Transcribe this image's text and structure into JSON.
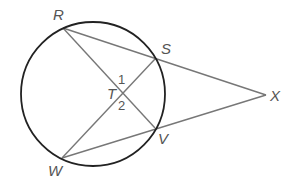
{
  "diagram": {
    "type": "circle-secants",
    "colors": {
      "circle": "#222222",
      "segment": "#777777",
      "label": "#555555",
      "background": "#ffffff"
    },
    "circle": {
      "cx": 93,
      "cy": 94,
      "r": 72
    },
    "points": {
      "R": {
        "label": "R",
        "x": 63,
        "y": 28,
        "lx": 53,
        "ly": 20
      },
      "S": {
        "label": "S",
        "x": 155,
        "y": 59,
        "lx": 161,
        "ly": 54
      },
      "V": {
        "label": "V",
        "x": 155,
        "y": 128,
        "lx": 158,
        "ly": 144
      },
      "W": {
        "label": "W",
        "x": 62,
        "y": 158,
        "lx": 48,
        "ly": 176
      },
      "X": {
        "label": "X",
        "x": 266,
        "y": 95,
        "lx": 270,
        "ly": 101
      },
      "T": {
        "label": "T",
        "x": 122,
        "y": 93,
        "lx": 107,
        "ly": 99
      }
    },
    "segments": [
      {
        "from": "R",
        "to": "X"
      },
      {
        "from": "W",
        "to": "X"
      },
      {
        "from": "R",
        "to": "V"
      },
      {
        "from": "W",
        "to": "S"
      }
    ],
    "angles": [
      {
        "label": "1",
        "x": 118,
        "y": 84
      },
      {
        "label": "2",
        "x": 118,
        "y": 110
      }
    ]
  }
}
